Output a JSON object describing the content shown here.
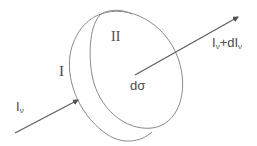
{
  "diagram": {
    "type": "radiative-transfer-cylinder",
    "labels": {
      "face_back": "I",
      "face_front": "II",
      "intensity_in_main": "I",
      "intensity_in_sub": "ν",
      "area_element": "dσ",
      "intensity_out_main": "I",
      "intensity_out_sub": "ν",
      "intensity_out_plus": "+dI",
      "intensity_out_sub2": "ν"
    },
    "colors": {
      "stroke": "#8a8a8a",
      "arrow": "#606060",
      "text": "#4a4a4a"
    }
  }
}
